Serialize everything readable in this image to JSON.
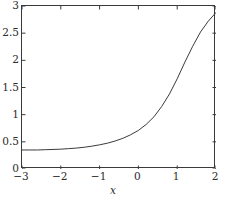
{
  "chart_data": {
    "type": "line",
    "title": "",
    "subtitle": "",
    "xlabel": "x",
    "ylabel": "",
    "xlim": [
      -3,
      2
    ],
    "ylim": [
      0,
      3
    ],
    "grid": false,
    "legend": null,
    "xticks": [
      -3,
      -2,
      -1,
      0,
      1,
      2
    ],
    "xticklabels": [
      "−3",
      "−2",
      "−1",
      "0",
      "1",
      "2"
    ],
    "yticks": [
      0,
      0.5,
      1,
      1.5,
      2,
      2.5,
      3
    ],
    "yticklabels": [
      "0",
      "0.5",
      "1",
      "1.5",
      "2",
      "2.5",
      "3"
    ],
    "line_color": "#3a3a3a",
    "axis_color": "#3a3a3a",
    "background": "#ffffff",
    "series": [
      {
        "name": "curve",
        "x": [
          -3.0,
          -2.8,
          -2.6,
          -2.4,
          -2.2,
          -2.0,
          -1.8,
          -1.6,
          -1.4,
          -1.2,
          -1.0,
          -0.8,
          -0.6,
          -0.4,
          -0.2,
          0.0,
          0.2,
          0.4,
          0.6,
          0.8,
          1.0,
          1.2,
          1.4,
          1.6,
          1.8,
          2.0
        ],
        "values": [
          0.35,
          0.35,
          0.35,
          0.355,
          0.36,
          0.365,
          0.375,
          0.385,
          0.4,
          0.42,
          0.445,
          0.475,
          0.515,
          0.565,
          0.63,
          0.71,
          0.82,
          0.96,
          1.15,
          1.38,
          1.66,
          1.97,
          2.26,
          2.52,
          2.72,
          2.88
        ]
      }
    ]
  },
  "axes": {
    "xtitle": "x"
  }
}
